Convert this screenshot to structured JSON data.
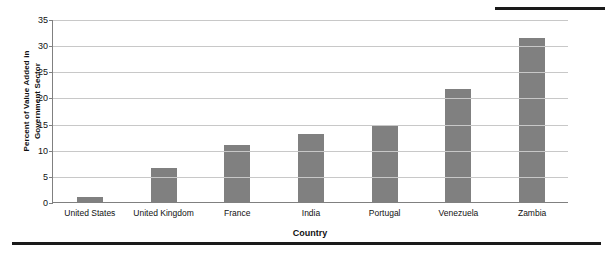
{
  "chart_data": {
    "type": "bar",
    "title": "",
    "xlabel": "Country",
    "ylabel": "Percent of Value Added in Government Sector",
    "ylabel_line1": "Percent of Value Added in",
    "ylabel_line2": "Government Sector",
    "categories": [
      "United States",
      "United Kingdom",
      "France",
      "India",
      "Portugal",
      "Venezuela",
      "Zambia"
    ],
    "values": [
      1.0,
      6.6,
      11.0,
      13.1,
      14.5,
      21.6,
      31.4
    ],
    "yticks": [
      0,
      5,
      10,
      15,
      20,
      25,
      30,
      35
    ],
    "ylim": [
      0,
      35
    ],
    "grid": true,
    "legend": "none",
    "bar_color": "#808080",
    "grid_color": "#c8c8c8",
    "axis_color": "#808080"
  }
}
